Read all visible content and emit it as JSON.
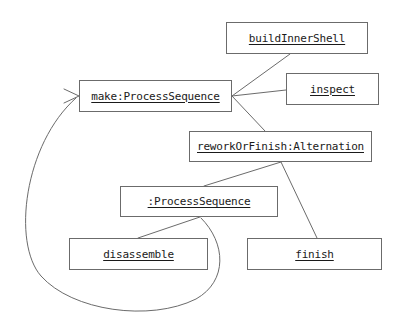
{
  "diagram": {
    "kind": "uml-object-collaboration-diagram",
    "background_color": "#ffffff",
    "line_color": "#6b6b6b",
    "text_color": "#1a1a1a",
    "nodes": [
      {
        "id": "buildInnerShell",
        "label": "buildInnerShell",
        "x": 226,
        "y": 22,
        "w": 142,
        "h": 32
      },
      {
        "id": "make",
        "label": "make:ProcessSequence",
        "x": 79,
        "y": 80,
        "w": 153,
        "h": 32
      },
      {
        "id": "inspect",
        "label": "inspect",
        "x": 286,
        "y": 73,
        "w": 93,
        "h": 32
      },
      {
        "id": "reworkOrFinish",
        "label": "reworkOrFinish:Alternation",
        "x": 189,
        "y": 131,
        "w": 183,
        "h": 31
      },
      {
        "id": "processSequence",
        "label": ":ProcessSequence",
        "x": 120,
        "y": 186,
        "w": 158,
        "h": 31
      },
      {
        "id": "disassemble",
        "label": "disassemble",
        "x": 69,
        "y": 238,
        "w": 139,
        "h": 32
      },
      {
        "id": "finish",
        "label": "finish",
        "x": 247,
        "y": 238,
        "w": 135,
        "h": 32
      }
    ],
    "edges": [
      {
        "id": "make-to-buildInnerShell",
        "from": "make",
        "to": "buildInnerShell",
        "kind": "straight",
        "points": [
          [
            232,
            96
          ],
          [
            290,
            54
          ]
        ]
      },
      {
        "id": "make-to-inspect",
        "from": "make",
        "to": "inspect",
        "kind": "straight",
        "points": [
          [
            232,
            96
          ],
          [
            286,
            90
          ]
        ]
      },
      {
        "id": "make-to-reworkOrFinish",
        "from": "make",
        "to": "reworkOrFinish",
        "kind": "straight",
        "points": [
          [
            232,
            96
          ],
          [
            265,
            131
          ]
        ]
      },
      {
        "id": "reworkOrFinish-to-processSequence",
        "from": "reworkOrFinish",
        "to": "processSequence",
        "kind": "straight",
        "points": [
          [
            281,
            162
          ],
          [
            204,
            186
          ]
        ]
      },
      {
        "id": "reworkOrFinish-to-finish",
        "from": "reworkOrFinish",
        "to": "finish",
        "kind": "straight",
        "points": [
          [
            281,
            162
          ],
          [
            317,
            238
          ]
        ]
      },
      {
        "id": "processSequence-to-disassemble",
        "from": "processSequence",
        "to": "disassemble",
        "kind": "straight",
        "points": [
          [
            200,
            217
          ],
          [
            138,
            238
          ]
        ]
      },
      {
        "id": "processSequence-to-make-loopback",
        "from": "processSequence",
        "to": "make",
        "kind": "curved-arrow",
        "arrowhead": "open",
        "path": "M 201 218 C 226 243 228 281 196 299 C 150 322 72 311 41 276 C 12 243 24 144 76 98"
      }
    ],
    "arrowhead": {
      "id": "make-inbound-arrowhead",
      "at": [
        78,
        96
      ],
      "points": [
        [
          64,
          89
        ],
        [
          79,
          96
        ],
        [
          64,
          103
        ]
      ]
    }
  }
}
